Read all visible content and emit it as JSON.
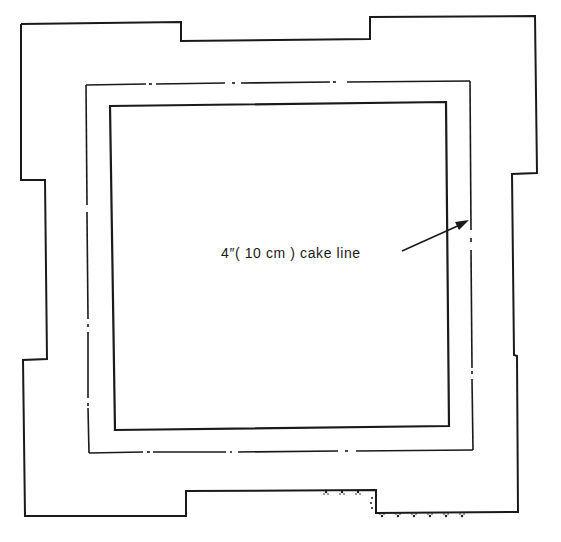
{
  "diagram": {
    "type": "cake-template",
    "colors": {
      "background": "#ffffff",
      "line": "#1a1a1a"
    },
    "annotation": {
      "label": "4″( 10 cm ) cake line",
      "target": "dash-dot cake line (middle rectangle)"
    },
    "shapes": [
      {
        "id": "outer-outline",
        "style": "solid",
        "description": "notched outer template outline"
      },
      {
        "id": "cake-line",
        "style": "dash-dot",
        "description": "4 inch (10 cm) cake line"
      },
      {
        "id": "inner-square",
        "style": "solid",
        "description": "inner square"
      }
    ]
  }
}
